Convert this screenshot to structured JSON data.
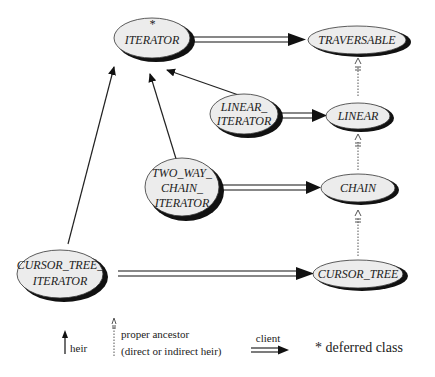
{
  "diagram": {
    "nodes": {
      "iterator": {
        "lines": [
          "ITERATOR"
        ],
        "deferred_marker": "*"
      },
      "traversable": {
        "lines": [
          "TRAVERSABLE"
        ]
      },
      "linear_iterator": {
        "lines": [
          "LINEAR_",
          "ITERATOR"
        ]
      },
      "linear": {
        "lines": [
          "LINEAR"
        ]
      },
      "two_way_chain_iterator": {
        "lines": [
          "TWO_WAY_",
          "CHAIN_",
          "ITERATOR"
        ]
      },
      "chain": {
        "lines": [
          "CHAIN"
        ]
      },
      "cursor_tree_iterator": {
        "lines": [
          "CURSOR_TREE_",
          "ITERATOR"
        ]
      },
      "cursor_tree": {
        "lines": [
          "CURSOR_TREE"
        ]
      }
    },
    "edges": [
      {
        "from": "iterator",
        "to": "traversable",
        "kind": "client"
      },
      {
        "from": "linear_iterator",
        "to": "iterator",
        "kind": "heir"
      },
      {
        "from": "linear_iterator",
        "to": "linear",
        "kind": "client"
      },
      {
        "from": "two_way_chain_iterator",
        "to": "iterator",
        "kind": "heir"
      },
      {
        "from": "two_way_chain_iterator",
        "to": "chain",
        "kind": "client"
      },
      {
        "from": "cursor_tree_iterator",
        "to": "iterator",
        "kind": "heir"
      },
      {
        "from": "cursor_tree_iterator",
        "to": "cursor_tree",
        "kind": "client"
      },
      {
        "from": "linear",
        "to": "traversable",
        "kind": "proper_ancestor"
      },
      {
        "from": "chain",
        "to": "linear",
        "kind": "proper_ancestor"
      },
      {
        "from": "cursor_tree",
        "to": "chain",
        "kind": "proper_ancestor"
      }
    ]
  },
  "legend": {
    "heir": "heir",
    "proper_ancestor_line1": "proper ancestor",
    "proper_ancestor_line2": "(direct or indirect heir)",
    "client": "client",
    "deferred": "* deferred class"
  }
}
